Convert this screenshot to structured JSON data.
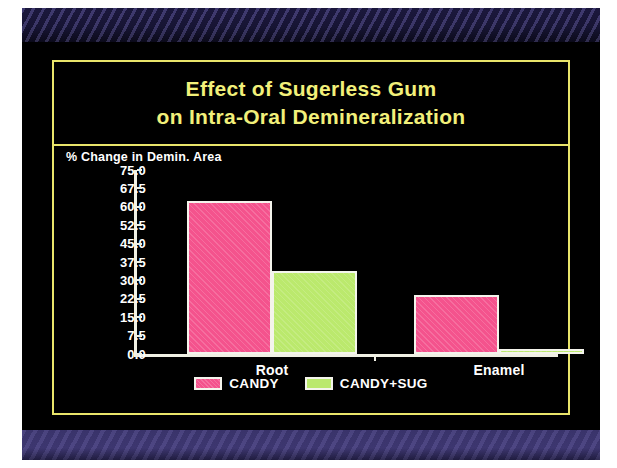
{
  "slide": {
    "title_line_1": "Effect of Sugerless Gum",
    "title_line_2": "on Intra-Oral Demineralization",
    "title_color": "#f2f07a",
    "border_color": "#e8e46a",
    "background_color": "#000000",
    "top_band_color": "#1a1738",
    "bottom_band_color": "#443c78"
  },
  "chart_data": {
    "type": "bar",
    "title": "Effect of Sugerless Gum on Intra-Oral Demineralization",
    "xlabel": "",
    "ylabel": "% Change in Demin. Area",
    "categories": [
      "Root",
      "Enamel"
    ],
    "series": [
      {
        "name": "CANDY",
        "color": "#f4538d",
        "values": [
          62.5,
          24.0
        ]
      },
      {
        "name": "CANDY+SUG",
        "color": "#bbe96d",
        "values": [
          34.0,
          2.0
        ]
      }
    ],
    "ylim": [
      0.0,
      75.0
    ],
    "ytick_step": 7.5,
    "ytick_labels": [
      "75.0",
      "67.5",
      "60.0",
      "52.5",
      "45.0",
      "37.5",
      "30.0",
      "22.5",
      "15.0",
      "7.5",
      "0.0"
    ],
    "ytick_values": [
      75.0,
      67.5,
      60.0,
      52.5,
      45.0,
      37.5,
      30.0,
      22.5,
      15.0,
      7.5,
      0.0
    ],
    "grid": false,
    "legend_position": "bottom",
    "legend_entries": [
      "CANDY",
      "CANDY+SUG"
    ]
  }
}
